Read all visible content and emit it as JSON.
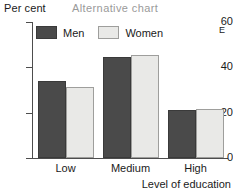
{
  "chart_data": {
    "type": "bar",
    "title": "Alternative chart",
    "panel_label": "E",
    "categories": [
      "Low",
      "Medium",
      "High"
    ],
    "series": [
      {
        "name": "Men",
        "color": "#4a4a4a",
        "values": [
          34,
          44.5,
          21
        ]
      },
      {
        "name": "Women",
        "color": "#e9e9e7",
        "values": [
          31.5,
          45.5,
          21.5
        ]
      }
    ],
    "xlabel": "Level of education",
    "ylabel": "Per cent",
    "ylim": [
      0,
      60
    ],
    "yticks": [
      0,
      20,
      40,
      60
    ],
    "ytick_labels": [
      "0",
      "20",
      "40",
      "60"
    ],
    "grid": false,
    "legend_position": "top-left-inside",
    "colors": {
      "men_fill": "#4a4a4a",
      "men_edge": "#3a3a3a",
      "women_fill": "#e9e9e7",
      "women_edge": "#9e9e9c",
      "axis": "#4d4d4d",
      "title": "#9a9a9a",
      "text": "#1a1a1a",
      "background": "#ffffff"
    }
  }
}
